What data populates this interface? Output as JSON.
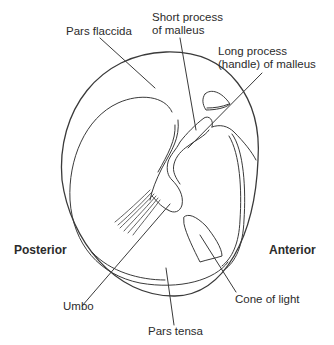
{
  "diagram": {
    "labels": {
      "pars_flaccida": "Pars flaccida",
      "short_process_line1": "Short process",
      "short_process_line2": "of malleus",
      "long_process_line1": "Long process",
      "long_process_line2": "(handle) of malleus",
      "posterior": "Posterior",
      "anterior": "Anterior",
      "umbo": "Umbo",
      "cone_of_light": "Cone of light",
      "pars_tensa": "Pars tensa"
    },
    "colors": {
      "line": "#3a3a3a",
      "background": "#ffffff"
    }
  }
}
